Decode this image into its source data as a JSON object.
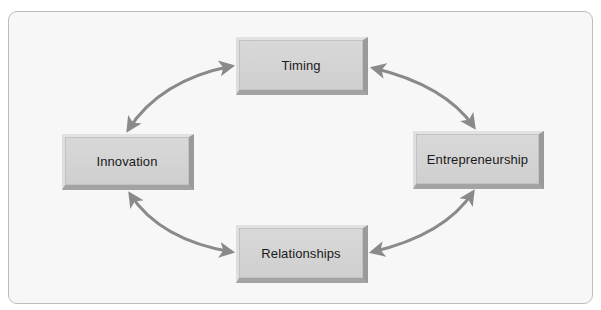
{
  "diagram": {
    "type": "cycle",
    "nodes": [
      {
        "id": "timing",
        "label": "Timing"
      },
      {
        "id": "innovation",
        "label": "Innovation"
      },
      {
        "id": "entrepreneurship",
        "label": "Entrepreneurship"
      },
      {
        "id": "relationships",
        "label": "Relationships"
      }
    ],
    "edges": [
      {
        "from": "timing",
        "to": "innovation",
        "bidirectional": true
      },
      {
        "from": "timing",
        "to": "entrepreneurship",
        "bidirectional": true
      },
      {
        "from": "innovation",
        "to": "relationships",
        "bidirectional": true
      },
      {
        "from": "entrepreneurship",
        "to": "relationships",
        "bidirectional": true
      }
    ],
    "colors": {
      "node_fill": "#d4d4d4",
      "node_bevel": "#9a9a9a",
      "arrow": "#8a8a8a",
      "frame_border": "#bdbdbd",
      "frame_fill": "#f7f7f7"
    }
  }
}
